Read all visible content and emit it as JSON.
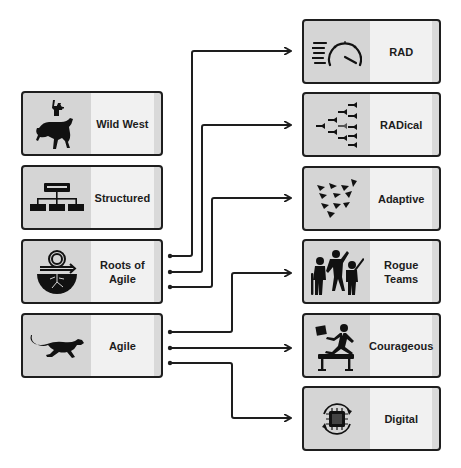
{
  "diagram": {
    "type": "evolution-mapping",
    "colors": {
      "border": "#1e1e1e",
      "icon_panel": "#d5d5d5",
      "label_panel": "#f1f1f1",
      "connector": "#1e1e1e",
      "background": "#ffffff"
    },
    "left_column": [
      {
        "id": "wild-west",
        "label": "Wild West",
        "icon": "cowboy-on-bucking-horse-icon"
      },
      {
        "id": "structured",
        "label": "Structured",
        "icon": "hierarchy-org-chart-icon"
      },
      {
        "id": "roots-of-agile",
        "label": "Roots of\nAgile",
        "icon": "cycle-arrow-with-roots-icon"
      },
      {
        "id": "agile",
        "label": "Agile",
        "icon": "running-cheetah-icon"
      }
    ],
    "right_column": [
      {
        "id": "rad",
        "label": "RAD",
        "icon": "speedometer-icon"
      },
      {
        "id": "radical",
        "label": "RADical",
        "icon": "fish-school-icon"
      },
      {
        "id": "adaptive",
        "label": "Adaptive",
        "icon": "paper-planes-flock-icon"
      },
      {
        "id": "rogue-teams",
        "label": "Rogue\nTeams",
        "icon": "rogue-kids-group-icon"
      },
      {
        "id": "courageous",
        "label": "Courageous",
        "icon": "businessman-hurdle-jump-icon"
      },
      {
        "id": "digital",
        "label": "Digital",
        "icon": "microchip-cycle-icon"
      }
    ],
    "connections": [
      {
        "from": "roots-of-agile",
        "to": "rad"
      },
      {
        "from": "roots-of-agile",
        "to": "radical"
      },
      {
        "from": "roots-of-agile",
        "to": "adaptive"
      },
      {
        "from": "agile",
        "to": "rogue-teams"
      },
      {
        "from": "agile",
        "to": "courageous"
      },
      {
        "from": "agile",
        "to": "digital"
      }
    ]
  }
}
